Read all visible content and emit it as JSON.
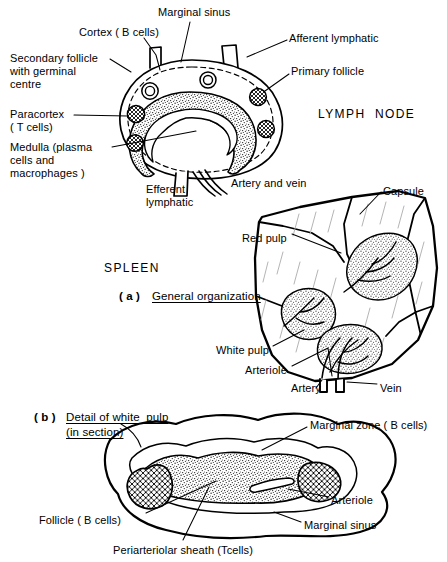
{
  "figure": {
    "title_lymph_node": "LYMPH  NODE",
    "title_spleen": "SPLEEN",
    "panel_a_marker": "( a )",
    "panel_a_caption": "General organization",
    "panel_b_marker": "( b )",
    "panel_b_caption_line1": "Detail of white  pulp",
    "panel_b_caption_line2": "(in section)"
  },
  "lymph_node": {
    "labels": [
      {
        "name": "marginal-sinus",
        "text": "Marginal sinus",
        "x": 158,
        "y": 6,
        "align": "left"
      },
      {
        "name": "cortex",
        "text": "Cortex ( B cells)",
        "x": 79,
        "y": 26,
        "align": "left"
      },
      {
        "name": "afferent-lymphatic",
        "text": "Afferent lymphatic",
        "x": 289,
        "y": 32,
        "align": "left"
      },
      {
        "name": "secondary-follicle",
        "text": "Secondary follicle\nwith germinal\ncentre",
        "x": 10,
        "y": 52,
        "align": "left"
      },
      {
        "name": "primary-follicle",
        "text": "Primary follicle",
        "x": 291,
        "y": 65,
        "align": "left"
      },
      {
        "name": "paracortex",
        "text": "Paracortex\n( T cells)",
        "x": 10,
        "y": 108,
        "align": "left"
      },
      {
        "name": "medulla",
        "text": "Medulla (plasma\ncells and\nmacrophages )",
        "x": 10,
        "y": 141,
        "align": "left"
      },
      {
        "name": "efferent-lymphatic",
        "text": "Efferent\nlymphatic",
        "x": 146,
        "y": 183,
        "align": "left"
      },
      {
        "name": "artery-and-vein",
        "text": "Artery and vein",
        "x": 231,
        "y": 177,
        "align": "left"
      }
    ]
  },
  "spleen": {
    "labels": [
      {
        "name": "capsule",
        "text": "Capsule",
        "x": 383,
        "y": 185,
        "align": "left"
      },
      {
        "name": "red-pulp",
        "text": "Red pulp",
        "x": 242,
        "y": 232,
        "align": "left"
      },
      {
        "name": "white-pulp",
        "text": "White pulp",
        "x": 216,
        "y": 344,
        "align": "left"
      },
      {
        "name": "arteriole",
        "text": "Arteriole",
        "x": 245,
        "y": 364,
        "align": "left"
      },
      {
        "name": "artery",
        "text": "Artery",
        "x": 291,
        "y": 382,
        "align": "left"
      },
      {
        "name": "vein",
        "text": "Vein",
        "x": 380,
        "y": 382,
        "align": "left"
      }
    ]
  },
  "white_pulp_detail": {
    "labels": [
      {
        "name": "marginal-zone",
        "text": "Marginal zone ( B cells)",
        "x": 310,
        "y": 419,
        "align": "left"
      },
      {
        "name": "arteriole-detail",
        "text": "Arteriole",
        "x": 331,
        "y": 494,
        "align": "left"
      },
      {
        "name": "follicle",
        "text": "Follicle ( B cells)",
        "x": 39,
        "y": 514,
        "align": "left"
      },
      {
        "name": "marginal-sinus-detail",
        "text": "Marginal sinus",
        "x": 304,
        "y": 519,
        "align": "left"
      },
      {
        "name": "periarteriolar-sheath",
        "text": "Periarteriolar sheath (Tcells)",
        "x": 113,
        "y": 544,
        "align": "left"
      }
    ]
  },
  "colors": {
    "ink": "#000000",
    "paper": "#ffffff",
    "stipple": "#3a3a3a",
    "faint_line": "#9a9a9a"
  }
}
